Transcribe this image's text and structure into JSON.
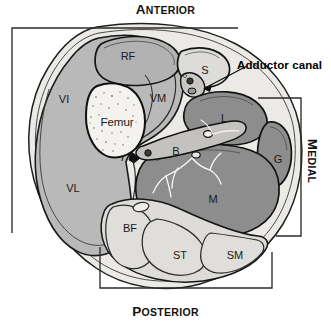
{
  "figure": {
    "orientation": {
      "anterior": {
        "lead": "A",
        "rest": "NTERIOR"
      },
      "posterior": {
        "lead": "P",
        "rest": "OSTERIOR"
      },
      "medial": {
        "lead": "M",
        "rest": "EDIAL"
      }
    },
    "annotation": {
      "text": "Adductor canal"
    },
    "structures": [
      {
        "id": "RF",
        "label": "RF",
        "x": 128,
        "y": 56,
        "compartment": "anterior"
      },
      {
        "id": "VI",
        "label": "VI",
        "x": 64,
        "y": 99,
        "compartment": "anterior"
      },
      {
        "id": "VM",
        "label": "VM",
        "x": 158,
        "y": 98,
        "compartment": "anterior"
      },
      {
        "id": "VL",
        "label": "VL",
        "x": 73,
        "y": 188,
        "compartment": "anterior"
      },
      {
        "id": "Femur",
        "label": "Femur",
        "x": 117,
        "y": 122,
        "compartment": "bone"
      },
      {
        "id": "S",
        "label": "S",
        "x": 205,
        "y": 70,
        "compartment": "sartorius"
      },
      {
        "id": "L",
        "label": "L",
        "x": 224,
        "y": 118,
        "compartment": "adductor"
      },
      {
        "id": "B",
        "label": "B",
        "x": 176,
        "y": 151,
        "compartment": "neurovascular"
      },
      {
        "id": "G",
        "label": "G",
        "x": 278,
        "y": 159,
        "compartment": "adductor"
      },
      {
        "id": "M",
        "label": "M",
        "x": 213,
        "y": 199,
        "compartment": "adductor"
      },
      {
        "id": "BF",
        "label": "BF",
        "x": 130,
        "y": 228,
        "compartment": "posterior"
      },
      {
        "id": "ST",
        "label": "ST",
        "x": 180,
        "y": 255,
        "compartment": "posterior"
      },
      {
        "id": "SM",
        "label": "SM",
        "x": 235,
        "y": 255,
        "compartment": "posterior"
      }
    ],
    "colors": {
      "bone": "#f4f2ee",
      "anterior_muscle": "#b9b9b9",
      "adductor_muscle": "#8d8d8d",
      "posterior_muscle": "#dddcd8",
      "fascia": "#eceae6",
      "outline": "#1a1a1a",
      "bracket": "#2b2b2b",
      "nerve": "#fbfbfb"
    }
  }
}
